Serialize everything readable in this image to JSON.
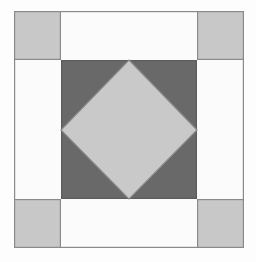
{
  "figure": {
    "name": "quilt-block-square-in-square",
    "canvas": {
      "width": 256,
      "height": 262,
      "background_color": "#fdfdfd"
    },
    "colors": {
      "background": "#fdfdfd",
      "frame_fill": "#fbfbfb",
      "corner_square_fill": "#c8c8c8",
      "center_square_fill": "#696969",
      "diamond_fill": "#c9c9c9",
      "stroke": "#8a8a8a",
      "stroke_dark": "#5c5c5c"
    },
    "stroke_width": 1.2
  },
  "shapes": {
    "outer_frame": {
      "label": "outer-frame",
      "x": 14,
      "y": 11,
      "width": 230,
      "height": 237,
      "fill": "#fbfbfb",
      "stroke": "#8a8a8a"
    },
    "corner_squares": [
      {
        "label": "corner-square-top-left",
        "x": 14,
        "y": 11,
        "width": 47,
        "height": 49,
        "fill": "#c8c8c8"
      },
      {
        "label": "corner-square-top-right",
        "x": 197,
        "y": 11,
        "width": 47,
        "height": 49,
        "fill": "#c8c8c8"
      },
      {
        "label": "corner-square-bottom-left",
        "x": 14,
        "y": 199,
        "width": 47,
        "height": 49,
        "fill": "#c8c8c8"
      },
      {
        "label": "corner-square-bottom-right",
        "x": 197,
        "y": 199,
        "width": 47,
        "height": 49,
        "fill": "#c8c8c8"
      }
    ],
    "center_square": {
      "label": "center-square",
      "x": 61,
      "y": 60,
      "width": 136,
      "height": 139,
      "fill": "#696969",
      "stroke": "#5c5c5c"
    },
    "diamond": {
      "label": "center-diamond",
      "fill": "#c9c9c9",
      "stroke": "#8a8a8a",
      "points": "129,60 197,130 129,199 61,130",
      "vertices": [
        {
          "name": "top",
          "x": 129,
          "y": 60
        },
        {
          "name": "right",
          "x": 197,
          "y": 130
        },
        {
          "name": "bottom",
          "x": 129,
          "y": 199
        },
        {
          "name": "left",
          "x": 61,
          "y": 130
        }
      ]
    }
  },
  "chart_data": {
    "type": "diagram",
    "title": "",
    "shape_count": 7,
    "layers": [
      {
        "name": "outer-frame",
        "shape": "rectangle",
        "fill": "#fbfbfb"
      },
      {
        "name": "corner-square-top-left",
        "shape": "rectangle",
        "fill": "#c8c8c8"
      },
      {
        "name": "corner-square-top-right",
        "shape": "rectangle",
        "fill": "#c8c8c8"
      },
      {
        "name": "corner-square-bottom-left",
        "shape": "rectangle",
        "fill": "#c8c8c8"
      },
      {
        "name": "corner-square-bottom-right",
        "shape": "rectangle",
        "fill": "#c8c8c8"
      },
      {
        "name": "center-square",
        "shape": "rectangle",
        "fill": "#696969"
      },
      {
        "name": "center-diamond",
        "shape": "rhombus",
        "fill": "#c9c9c9"
      }
    ]
  }
}
